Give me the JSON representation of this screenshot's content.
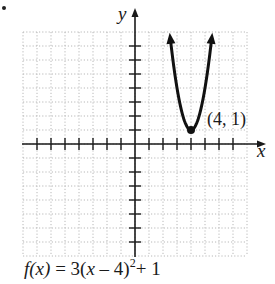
{
  "figure": {
    "bullet": "•",
    "axis_labels": {
      "x": "x",
      "y": "y"
    },
    "vertex_label": "(4, 1)",
    "caption": {
      "lhs": "f(x)",
      "equals": " = 3(",
      "var": "x",
      "rest": " – 4)",
      "exp": "2",
      "tail": "+ 1",
      "full": "f(x) = 3(x – 4)^2 + 1"
    }
  },
  "chart_data": {
    "type": "line",
    "title": "",
    "function": "f(x) = 3(x - 4)^2 + 1",
    "xlabel": "x",
    "ylabel": "y",
    "xlim": [
      -8,
      8
    ],
    "ylim": [
      -8,
      8
    ],
    "grid": true,
    "tick_step": 1,
    "vertex": {
      "x": 4,
      "y": 1,
      "label": "(4, 1)"
    },
    "series": [
      {
        "name": "f(x)",
        "x": [
          2.55,
          3.0,
          3.5,
          4.0,
          4.5,
          5.0,
          5.45
        ],
        "y": [
          7.31,
          4.0,
          1.75,
          1.0,
          1.75,
          4.0,
          7.31
        ],
        "arrows_both_ends": true
      }
    ],
    "colors": {
      "grid": "#b8b8b8",
      "axes": "#1a1a1a",
      "curve": "#111111"
    }
  }
}
